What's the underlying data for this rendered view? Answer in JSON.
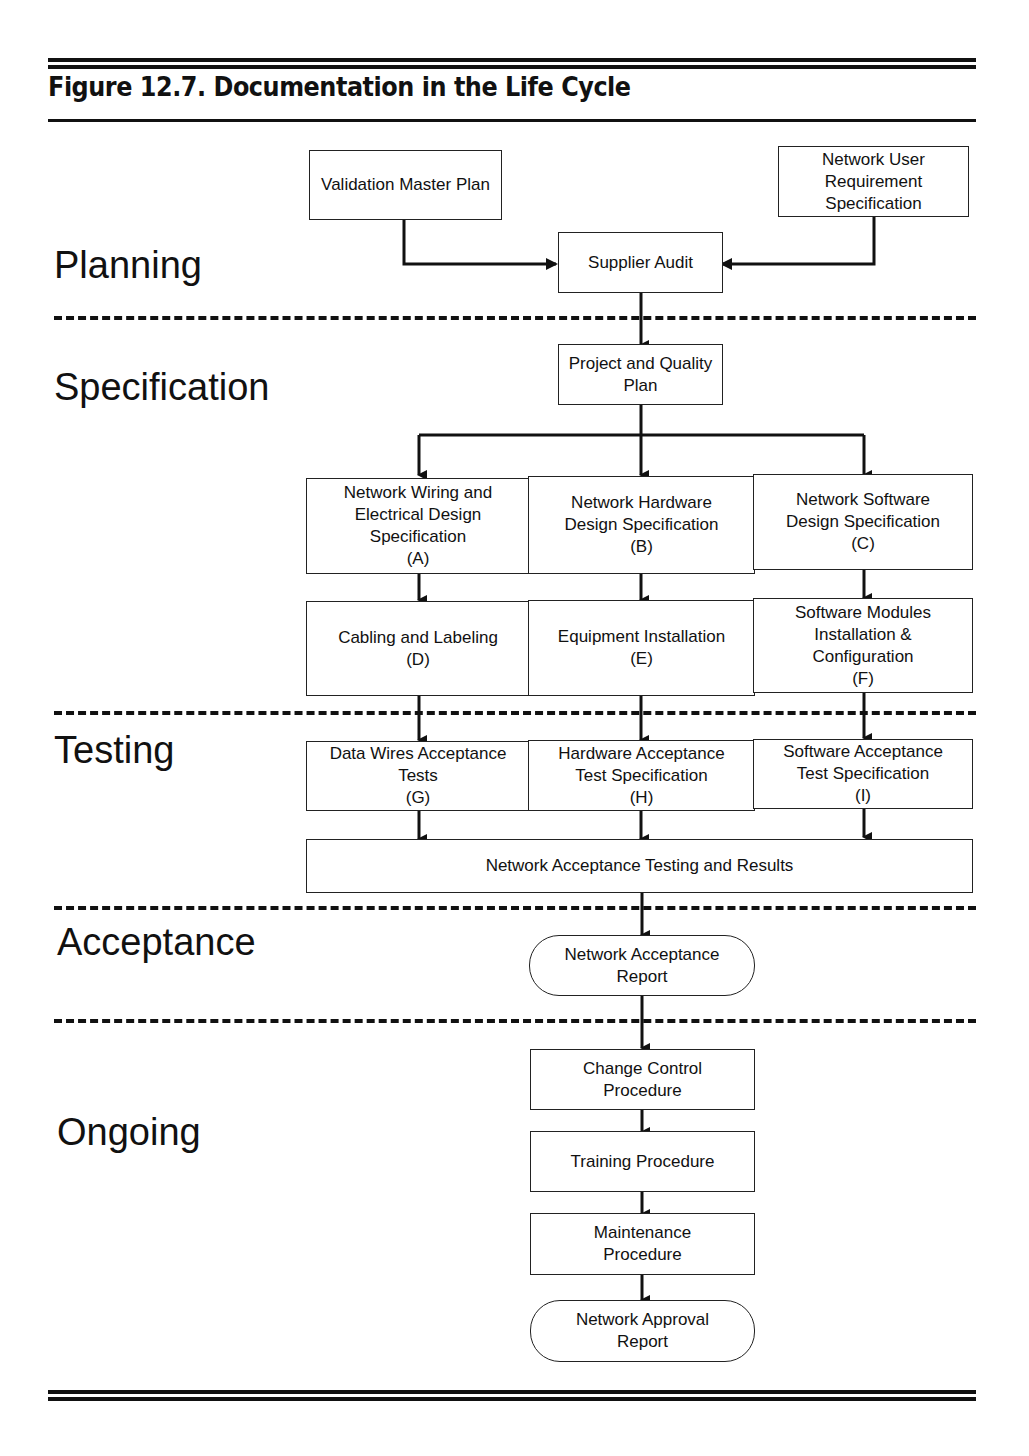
{
  "figure": {
    "title": "Figure 12.7. Documentation in the Life Cycle"
  },
  "phases": [
    "Planning",
    "Specification",
    "Testing",
    "Acceptance",
    "Ongoing"
  ],
  "nodes": {
    "validation_master_plan": "Validation Master Plan",
    "network_user_requirement_spec": "Network User\nRequirement\nSpecification",
    "supplier_audit": "Supplier Audit",
    "project_quality_plan": "Project and Quality\nPlan",
    "a": "Network Wiring and\nElectrical Design\nSpecification\n(A)",
    "b": "Network Hardware\nDesign Specification\n(B)",
    "c": "Network Software\nDesign Specification\n(C)",
    "d": "Cabling and Labeling\n(D)",
    "e": "Equipment Installation\n(E)",
    "f": "Software Modules\nInstallation &\nConfiguration\n(F)",
    "g": "Data Wires Acceptance\nTests\n(G)",
    "h": "Hardware Acceptance\nTest Specification\n(H)",
    "i": "Software Acceptance\nTest Specification\n(I)",
    "network_acceptance_testing": "Network Acceptance Testing and Results",
    "network_acceptance_report": "Network Acceptance\nReport",
    "change_control": "Change Control\nProcedure",
    "training": "Training Procedure",
    "maintenance": "Maintenance\nProcedure",
    "network_approval_report": "Network Approval\nReport"
  }
}
